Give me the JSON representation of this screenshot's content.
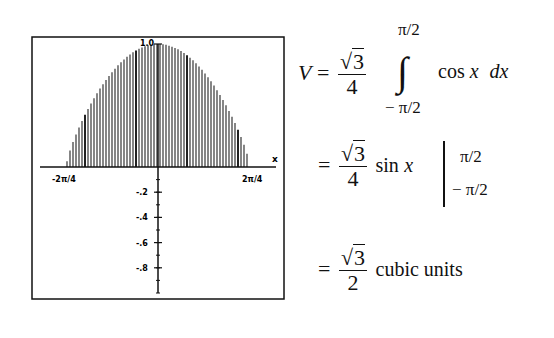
{
  "chart_data": {
    "type": "area",
    "title": "",
    "function": "cos x (scaled)",
    "xlabel": "x",
    "ylabel": "",
    "x_tick_labels": [
      "-2π/4",
      "2π/4"
    ],
    "x_range": [
      -1.5708,
      1.5708
    ],
    "y_tick_labels": [
      "1.0",
      "-.2",
      "-.4",
      "-.6",
      "-.8"
    ],
    "y_ticks": [
      1.0,
      -0.2,
      -0.4,
      -0.6,
      -0.8
    ],
    "ylim": [
      -1.0,
      1.0
    ],
    "shading": "vertical hatching under curve",
    "grid": false,
    "x": [
      -1.5708,
      -1.1781,
      -0.7854,
      -0.3927,
      0,
      0.3927,
      0.7854,
      1.1781,
      1.5708
    ],
    "values": [
      0.0,
      0.383,
      0.707,
      0.924,
      1.0,
      0.924,
      0.707,
      0.383,
      0.0
    ]
  },
  "equations": {
    "line1": {
      "lhs": "V",
      "equals": "=",
      "coef_num": "3",
      "coef_den": "4",
      "upper_limit": "π/2",
      "lower_limit": "− π/2",
      "integral": "∫",
      "integrand": "cos",
      "var": "x",
      "differential": "dx"
    },
    "line2": {
      "equals": "=",
      "coef_num": "3",
      "coef_den": "4",
      "func": "sin",
      "var": "x",
      "upper_limit": "π/2",
      "lower_limit": "− π/2"
    },
    "line3": {
      "equals": "=",
      "coef_num": "3",
      "coef_den": "2",
      "units": "cubic units"
    }
  }
}
